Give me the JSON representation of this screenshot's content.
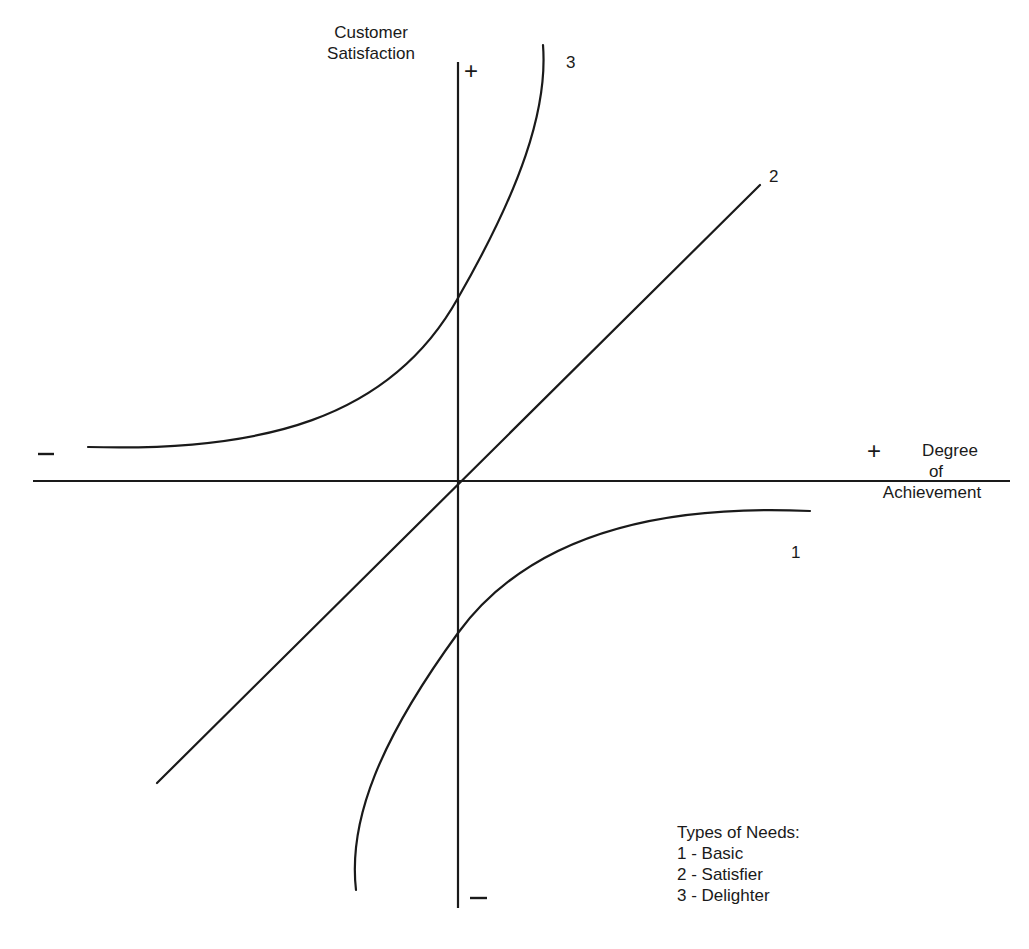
{
  "diagram": {
    "y_axis": {
      "label_line1": "Customer",
      "label_line2": "Satisfaction",
      "positive_sign": "+",
      "negative_sign": "–"
    },
    "x_axis": {
      "label_line1": "Degree",
      "label_line2": "of",
      "label_line3": "Achievement",
      "positive_sign": "+",
      "negative_sign": "–"
    },
    "curves": [
      {
        "id": "1",
        "label": "1",
        "name": "Basic",
        "shape": "concave, below axis, saturating toward zero"
      },
      {
        "id": "2",
        "label": "2",
        "name": "Satisfier",
        "shape": "straight line through origin"
      },
      {
        "id": "3",
        "label": "3",
        "name": "Delighter",
        "shape": "convex, above axis, rising steeply"
      }
    ],
    "legend": {
      "title": "Types of Needs:",
      "items": [
        {
          "text": "1 - Basic"
        },
        {
          "text": "2 - Satisfier"
        },
        {
          "text": "3 - Delighter"
        }
      ]
    },
    "colors": {
      "stroke": "#1a1a1a",
      "background": "#ffffff"
    }
  }
}
